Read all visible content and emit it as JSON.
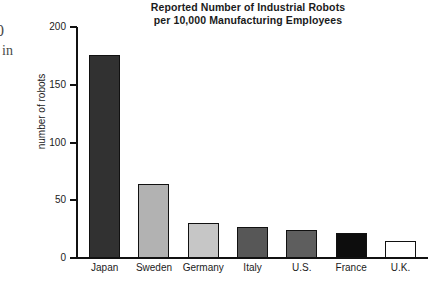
{
  "page": {
    "background": "#ffffff",
    "margin_fragments": [
      {
        "name": "clipped-digit",
        "text": "0"
      },
      {
        "name": "clipped-word",
        "text": "in"
      }
    ]
  },
  "chart_data": {
    "type": "bar",
    "title": "Reported Number of Industrial Robots per 10,000 Manufacturing Employees",
    "title_lines": [
      "Reported Number of Industrial Robots",
      "per 10,000 Manufacturing Employees"
    ],
    "xlabel": "",
    "ylabel": "number of robots",
    "ylim": [
      0,
      200
    ],
    "ytick_labels": [
      "200",
      "150",
      "100",
      "50",
      "0"
    ],
    "yticks": [
      200,
      150,
      100,
      50,
      0
    ],
    "grid": false,
    "legend": false,
    "categories": [
      "Japan",
      "Sweden",
      "Germany",
      "Italy",
      "U.S.",
      "France",
      "U.K."
    ],
    "values": [
      176,
      64,
      30,
      27,
      24,
      22,
      15
    ],
    "bar_colors": [
      "#313131",
      "#b2b2b2",
      "#c6c6c6",
      "#575757",
      "#5e5e5e",
      "#0d0d0d",
      "#ffffff"
    ],
    "bar_edge_color": "#111111",
    "bars": [
      {
        "label": "Japan",
        "value": 176,
        "fill": "#313131"
      },
      {
        "label": "Sweden",
        "value": 64,
        "fill": "#b2b2b2"
      },
      {
        "label": "Germany",
        "value": 30,
        "fill": "#c6c6c6"
      },
      {
        "label": "Italy",
        "value": 27,
        "fill": "#575757"
      },
      {
        "label": "U.S.",
        "value": 24,
        "fill": "#5e5e5e"
      },
      {
        "label": "France",
        "value": 22,
        "fill": "#0d0d0d"
      },
      {
        "label": "U.K.",
        "value": 15,
        "fill": "#ffffff"
      }
    ]
  }
}
